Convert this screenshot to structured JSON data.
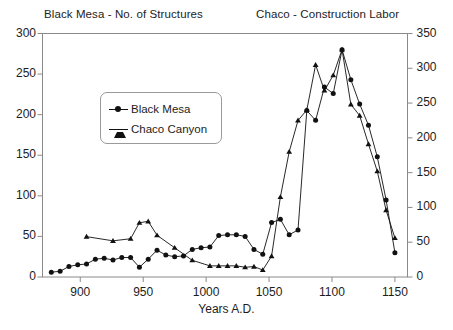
{
  "titles": {
    "left": "Black Mesa - No. of Structures",
    "right": "Chaco - Construction Labor"
  },
  "legend": {
    "items": [
      {
        "label": "Black Mesa",
        "marker": "circle-marker",
        "color": "#111111"
      },
      {
        "label": "Chaco Canyon",
        "marker": "triangle-marker",
        "color": "#111111"
      }
    ]
  },
  "axes": {
    "x": {
      "title": "Years A.D.",
      "ticks": [
        "900",
        "950",
        "1000",
        "1050",
        "1100",
        "1150"
      ],
      "min": 870,
      "max": 1160
    },
    "y_left": {
      "ticks": [
        "0",
        "50",
        "100",
        "150",
        "200",
        "250",
        "300"
      ],
      "min": 0,
      "max": 300
    },
    "y_right": {
      "ticks": [
        "0",
        "50",
        "100",
        "150",
        "200",
        "250",
        "300",
        "350"
      ],
      "min": 0,
      "max": 350
    }
  },
  "chart_data": {
    "type": "line",
    "xlabel": "Years A.D.",
    "ylabel": "No. of Structures",
    "ylabel_secondary": "Construction Labor",
    "xlim": [
      870,
      1160
    ],
    "ylim": [
      0,
      300
    ],
    "ylim_secondary": [
      0,
      350
    ],
    "grid": false,
    "legend_position": "upper-left-inside",
    "series": [
      {
        "name": "Black Mesa",
        "marker": "circle",
        "color": "#111111",
        "axis": "left",
        "points": [
          [
            877,
            6
          ],
          [
            884,
            7
          ],
          [
            891,
            13
          ],
          [
            898,
            15
          ],
          [
            905,
            16
          ],
          [
            912,
            22
          ],
          [
            919,
            23
          ],
          [
            926,
            21
          ],
          [
            933,
            24
          ],
          [
            940,
            24
          ],
          [
            947,
            12
          ],
          [
            954,
            22
          ],
          [
            961,
            33
          ],
          [
            968,
            27
          ],
          [
            975,
            25
          ],
          [
            982,
            26
          ],
          [
            989,
            34
          ],
          [
            996,
            36
          ],
          [
            1003,
            37
          ],
          [
            1010,
            51
          ],
          [
            1017,
            52
          ],
          [
            1024,
            52
          ],
          [
            1031,
            50
          ],
          [
            1038,
            34
          ],
          [
            1045,
            28
          ],
          [
            1052,
            67
          ],
          [
            1059,
            71
          ],
          [
            1066,
            52
          ],
          [
            1073,
            58
          ],
          [
            1080,
            205
          ],
          [
            1087,
            193
          ],
          [
            1094,
            234
          ],
          [
            1101,
            226
          ],
          [
            1108,
            280
          ],
          [
            1115,
            243
          ],
          [
            1122,
            213
          ],
          [
            1129,
            187
          ],
          [
            1136,
            148
          ],
          [
            1143,
            95
          ],
          [
            1150,
            30
          ]
        ]
      },
      {
        "name": "Chaco Canyon",
        "marker": "triangle",
        "color": "#111111",
        "axis": "right",
        "points": [
          [
            905,
            58
          ],
          [
            926,
            52
          ],
          [
            940,
            55
          ],
          [
            947,
            78
          ],
          [
            954,
            80
          ],
          [
            961,
            60
          ],
          [
            975,
            42
          ],
          [
            989,
            24
          ],
          [
            1003,
            16
          ],
          [
            1010,
            16
          ],
          [
            1017,
            16
          ],
          [
            1024,
            16
          ],
          [
            1031,
            14
          ],
          [
            1038,
            15
          ],
          [
            1045,
            10
          ],
          [
            1052,
            30
          ],
          [
            1059,
            115
          ],
          [
            1066,
            180
          ],
          [
            1073,
            225
          ],
          [
            1080,
            240
          ],
          [
            1087,
            305
          ],
          [
            1094,
            268
          ],
          [
            1101,
            290
          ],
          [
            1108,
            327
          ],
          [
            1115,
            248
          ],
          [
            1122,
            232
          ],
          [
            1129,
            191
          ],
          [
            1136,
            152
          ],
          [
            1143,
            96
          ],
          [
            1150,
            56
          ]
        ]
      }
    ]
  },
  "colors": {
    "line": "#111111",
    "axis": "#7a7a7a",
    "text": "#1d1d1d",
    "background": "#ffffff"
  }
}
